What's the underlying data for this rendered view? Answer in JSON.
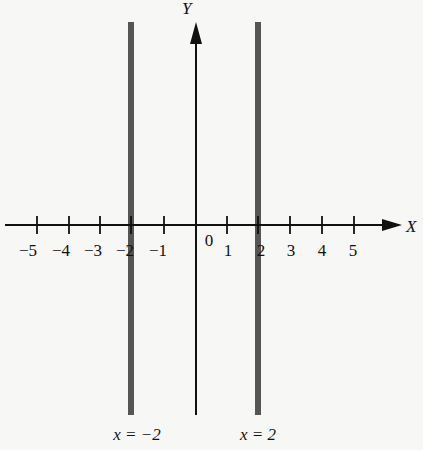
{
  "axes": {
    "x_label": "X",
    "y_label": "Y",
    "origin_label": "0"
  },
  "x_ticks": [
    "−5",
    "−4",
    "−3",
    "−2",
    "−1",
    "1",
    "2",
    "3",
    "4",
    "5"
  ],
  "lines": [
    {
      "label": "x = −2",
      "x": -2
    },
    {
      "label": "x = 2",
      "x": 2
    }
  ],
  "colors": {
    "axis": "#111111",
    "line": "#555555",
    "background": "#f7f7f5"
  }
}
